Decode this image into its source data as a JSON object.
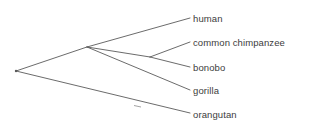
{
  "figure": {
    "type": "phylogenetic-tree",
    "background_color": "#ffffff",
    "line_color": "#5a5a5a",
    "text_color": "#3c3c3c",
    "width": 310,
    "height": 135
  },
  "tree": {
    "root": {
      "name": "root-node",
      "x": 16,
      "y": 71
    },
    "internal_nodes": [
      {
        "name": "african-ape-node",
        "x": 87,
        "y": 47
      },
      {
        "name": "pan-node",
        "x": 150,
        "y": 57
      }
    ],
    "branches": [
      {
        "name": "branch-root-to-african-ape",
        "x1": 16,
        "y1": 71,
        "x2": 87,
        "y2": 47
      },
      {
        "name": "branch-root-to-orangutan",
        "x1": 16,
        "y1": 71,
        "x2": 190,
        "y2": 113
      },
      {
        "name": "branch-african-ape-to-human",
        "x1": 87,
        "y1": 47,
        "x2": 190,
        "y2": 18
      },
      {
        "name": "branch-african-ape-to-pan",
        "x1": 87,
        "y1": 47,
        "x2": 150,
        "y2": 57
      },
      {
        "name": "branch-african-ape-to-gorilla",
        "x1": 87,
        "y1": 47,
        "x2": 190,
        "y2": 90
      },
      {
        "name": "branch-pan-to-chimpanzee",
        "x1": 150,
        "y1": 57,
        "x2": 190,
        "y2": 42
      },
      {
        "name": "branch-pan-to-bonobo",
        "x1": 150,
        "y1": 57,
        "x2": 190,
        "y2": 67
      }
    ],
    "tips": [
      {
        "name": "tip-human",
        "label": "human",
        "x": 193,
        "y": 13
      },
      {
        "name": "tip-common-chimpanzee",
        "label": "common chimpanzee",
        "x": 193,
        "y": 37
      },
      {
        "name": "tip-bonobo",
        "label": "bonobo",
        "x": 193,
        "y": 62
      },
      {
        "name": "tip-gorilla",
        "label": "gorilla",
        "x": 193,
        "y": 85
      },
      {
        "name": "tip-orangutan",
        "label": "orangutan",
        "x": 193,
        "y": 109
      }
    ],
    "marker": {
      "name": "branch-marker-orangutan",
      "x": 137,
      "y": 105
    }
  }
}
